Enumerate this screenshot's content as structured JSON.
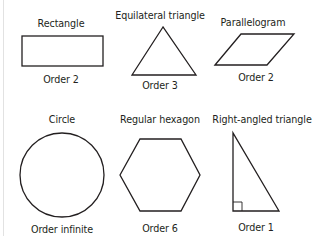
{
  "figure": {
    "stroke_color": "#231f20",
    "shapes": [
      {
        "name": "Rectangle",
        "order": "Order 2"
      },
      {
        "name": "Equilateral triangle",
        "order": "Order 3"
      },
      {
        "name": "Parallelogram",
        "order": "Order 2"
      },
      {
        "name": "Circle",
        "order": "Order infinite"
      },
      {
        "name": "Regular hexagon",
        "order": "Order 6"
      },
      {
        "name": "Right-angled triangle",
        "order": "Order 1"
      }
    ]
  }
}
